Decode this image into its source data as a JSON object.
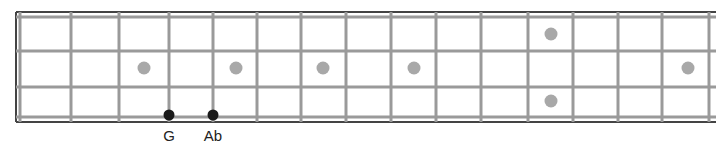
{
  "diagram": {
    "type": "bass-fretboard",
    "strings": 4,
    "colors": {
      "border": "#444444",
      "line": "#9a9a9a",
      "inlay": "#a8a8a8",
      "note": "#1a1a1a",
      "label": "#222222"
    },
    "frame": {
      "left": 16,
      "right": 716,
      "top": 12,
      "bottom": 122
    },
    "nut_x": 20,
    "string_y": [
      17,
      51,
      87,
      117
    ],
    "fret_x": [
      71,
      119,
      169,
      213,
      257,
      301,
      346,
      391,
      436,
      481,
      528,
      573,
      618,
      662,
      709
    ],
    "inlays": [
      {
        "x": 144,
        "y": 68
      },
      {
        "x": 236,
        "y": 68
      },
      {
        "x": 323,
        "y": 68
      },
      {
        "x": 414,
        "y": 68
      },
      {
        "x": 551,
        "y": 34
      },
      {
        "x": 551,
        "y": 101
      },
      {
        "x": 688,
        "y": 68
      }
    ],
    "notes": [
      {
        "x": 169,
        "y": 115,
        "label": "G"
      },
      {
        "x": 213,
        "y": 115,
        "label": "Ab"
      }
    ]
  }
}
